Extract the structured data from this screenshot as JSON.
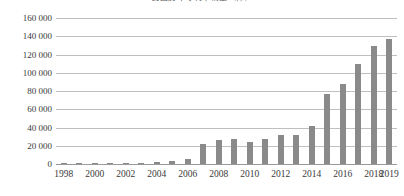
{
  "chart_data": {
    "type": "bar",
    "title": "我国历年专利申请量（件）",
    "xlabel": "",
    "ylabel": "",
    "ylim": [
      0,
      160000
    ],
    "ytick_step": 20000,
    "ytick_labels": [
      "0",
      "20 000",
      "40 000",
      "60 000",
      "80 000",
      "100 000",
      "120 000",
      "140 000",
      "160 000"
    ],
    "ytick_values": [
      0,
      20000,
      40000,
      60000,
      80000,
      100000,
      120000,
      140000,
      160000
    ],
    "grid": true,
    "legend": false,
    "bar_color": "#8a8a8a",
    "gridline_color": "#bfbfbf",
    "categories": [
      "1998",
      "1999",
      "2000",
      "2001",
      "2002",
      "2003",
      "2004",
      "2005",
      "2006",
      "2007",
      "2008",
      "2009",
      "2010",
      "2011",
      "2012",
      "2013",
      "2014",
      "2015",
      "2016",
      "2017",
      "2018",
      "2019"
    ],
    "xtick_labels": [
      "1998",
      "",
      "2000",
      "",
      "2002",
      "",
      "2004",
      "",
      "2006",
      "",
      "2008",
      "",
      "2010",
      "",
      "2012",
      "",
      "2014",
      "",
      "2016",
      "",
      "2018",
      "2019"
    ],
    "values": [
      300,
      400,
      500,
      700,
      900,
      1200,
      1800,
      3500,
      5200,
      22000,
      26000,
      27000,
      24000,
      27000,
      32000,
      31500,
      42000,
      76500,
      88000,
      110000,
      129000,
      137000
    ]
  }
}
